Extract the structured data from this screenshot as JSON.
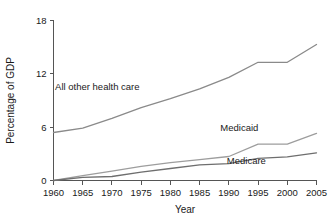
{
  "chart_data": {
    "type": "line",
    "title": "",
    "xlabel": "Year",
    "ylabel": "Percentage of GDP",
    "x": [
      1960,
      1965,
      1970,
      1975,
      1980,
      1985,
      1990,
      1995,
      2000,
      2005
    ],
    "xlim": [
      1960,
      2005
    ],
    "ylim": [
      0,
      18
    ],
    "xticks": [
      1960,
      1965,
      1970,
      1975,
      1980,
      1985,
      1990,
      1995,
      2000,
      2005
    ],
    "xtick_labels": [
      "1960",
      "1965",
      "1970",
      "1975",
      "1980",
      "1985",
      "1990",
      "1995",
      "2000",
      "2005"
    ],
    "yticks": [
      0,
      6,
      12,
      18
    ],
    "ytick_labels": [
      "0",
      "6",
      "12",
      "18"
    ],
    "grid": false,
    "legend_position": "inline-annotations",
    "series": [
      {
        "name": "All other health care",
        "color": "#8a8a8a",
        "values": [
          5.4,
          5.9,
          7.0,
          8.2,
          9.2,
          10.3,
          11.6,
          13.3,
          13.3,
          15.3
        ],
        "label": "All other health care",
        "label_x": 1967.5,
        "label_y": 10.2
      },
      {
        "name": "Medicaid",
        "color": "#9d9d9d",
        "values": [
          0.0,
          0.55,
          1.05,
          1.6,
          2.0,
          2.35,
          2.7,
          4.1,
          4.1,
          5.3
        ],
        "label": "Medicaid",
        "label_x": 1991.8,
        "label_y": 5.6
      },
      {
        "name": "Medicare",
        "color": "#6e6e6e",
        "values": [
          0.0,
          0.35,
          0.45,
          0.95,
          1.35,
          1.75,
          1.9,
          2.5,
          2.65,
          3.1
        ],
        "label": "Medicare",
        "label_x": 1993.0,
        "label_y": 1.85
      }
    ]
  },
  "colors": {
    "background": "#ffffff",
    "axis": "#555555",
    "text": "#1a1a1a",
    "series_all_other": "#8a8a8a",
    "series_medicaid": "#9d9d9d",
    "series_medicare": "#6e6e6e"
  }
}
